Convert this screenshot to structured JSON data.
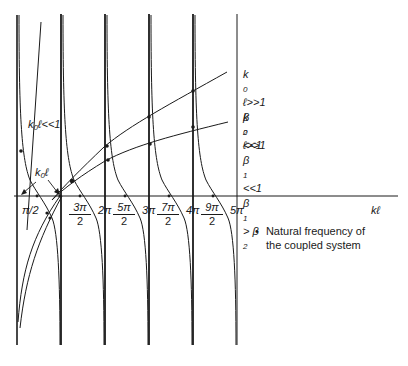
{
  "diagram": {
    "type": "graphical-solution-plot",
    "x_axis_label": "kℓ",
    "x_ticks": [
      {
        "label": "π/2",
        "kind": "inline"
      },
      {
        "num": "3π",
        "den": "2",
        "kind": "fraction"
      },
      {
        "label": "2π",
        "kind": "inline"
      },
      {
        "num": "5π",
        "den": "2",
        "kind": "fraction"
      },
      {
        "label": "3π",
        "kind": "inline"
      },
      {
        "num": "7π",
        "den": "2",
        "kind": "fraction"
      },
      {
        "label": "4π",
        "kind": "inline"
      },
      {
        "num": "9π",
        "den": "2",
        "kind": "fraction"
      },
      {
        "label": "5π",
        "kind": "inline"
      }
    ],
    "annotations": {
      "small_k0l": {
        "k": "k",
        "sub": "0",
        "rest": "ℓ<<1"
      },
      "k0l_pointer": {
        "k": "k",
        "sub": "0",
        "rest": "ℓ"
      },
      "upper_line": {
        "line1": {
          "k": "k",
          "sub": "0",
          "rest": "ℓ>>1"
        },
        "line2": {
          "b": "β",
          "sub": "2",
          "rest": "<<1"
        }
      },
      "lower_line": {
        "line1": {
          "k": "k",
          "sub": "0",
          "rest": "ℓ>>1"
        },
        "line2": {
          "b": "β",
          "sub": "1",
          "rest": "<<1"
        },
        "line3": {
          "b": "β",
          "sub": "1",
          "mid": " > β",
          "sub2": "2"
        }
      }
    },
    "legend": {
      "bullet": "•",
      "line1": "Natural frequency of",
      "line2": "the coupled system"
    },
    "colors": {
      "ink": "#1a1a1a",
      "background": "#ffffff"
    }
  }
}
